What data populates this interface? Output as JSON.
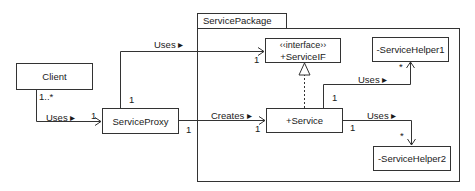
{
  "diagram": {
    "type": "UML class diagram",
    "package": {
      "name": "ServicePackage"
    },
    "classes": {
      "client": {
        "name": "Client"
      },
      "proxy": {
        "name": "ServiceProxy"
      },
      "interface": {
        "stereotype": "‹‹interface››",
        "name": "+ServiceIF"
      },
      "service": {
        "name": "+Service"
      },
      "helper1": {
        "name": "-ServiceHelper1"
      },
      "helper2": {
        "name": "-ServiceHelper2"
      }
    },
    "relations": {
      "client_proxy": {
        "label": "Uses ▸",
        "source_mult": "1..*",
        "target_mult": "1"
      },
      "proxy_interface": {
        "label": "Uses ▸",
        "source_mult": "1",
        "target_mult": "1"
      },
      "proxy_service": {
        "label": "Creates ▸",
        "source_mult": "1",
        "target_mult": "1"
      },
      "service_helper1": {
        "label": "Uses ▸",
        "source_mult": "1",
        "target_mult": "*"
      },
      "service_helper2": {
        "label": "Uses ▸",
        "source_mult": "1",
        "target_mult": "*"
      },
      "service_realizes_interface": {
        "kind": "realization"
      }
    },
    "colors": {
      "line": "#333333",
      "background": "#ffffff",
      "text": "#1a1a1a"
    }
  }
}
